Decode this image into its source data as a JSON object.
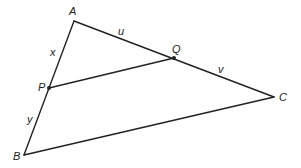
{
  "diagram": {
    "type": "triangle-with-parallel-segment",
    "points": {
      "A": {
        "label": "A",
        "x": 74,
        "y": 21
      },
      "B": {
        "label": "B",
        "x": 24,
        "y": 155
      },
      "C": {
        "label": "C",
        "x": 274,
        "y": 97
      },
      "P": {
        "label": "P",
        "x": 49,
        "y": 88
      },
      "Q": {
        "label": "Q",
        "x": 174,
        "y": 58
      }
    },
    "segment_labels": {
      "AP": "x",
      "PB": "y",
      "AQ": "u",
      "QC": "v"
    },
    "stroke_color": "#222222"
  }
}
